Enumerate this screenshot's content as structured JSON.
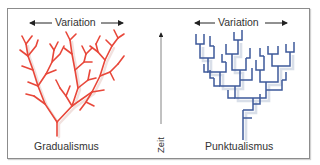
{
  "panels": {
    "left": {
      "title": "Gradualismus",
      "variation_label": "Variation",
      "tree_color": "#e8473a",
      "tree_style": "diagonal-branching"
    },
    "right": {
      "title": "Punktualismus",
      "variation_label": "Variation",
      "tree_color": "#3e5a9a",
      "tree_style": "orthogonal-stepped-branching"
    }
  },
  "axis": {
    "time_label": "Zeit",
    "direction": "up"
  },
  "colors": {
    "frame_border": "#8c8c8c",
    "text": "#333333",
    "shadow": "#c9d2e0"
  }
}
